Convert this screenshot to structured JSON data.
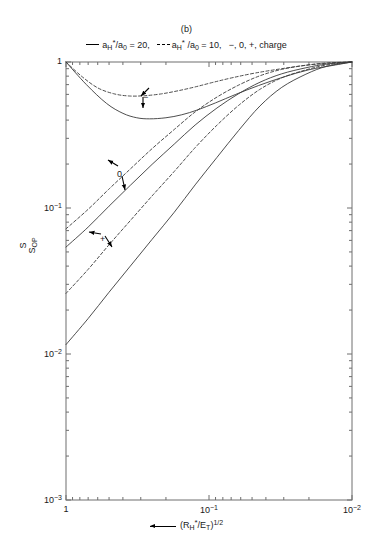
{
  "figure": {
    "panel_label": "(b)",
    "legend": {
      "entry1": {
        "style": "solid",
        "text_pre": "a",
        "sub1": "H",
        "ast": "*",
        "mid": "/a",
        "sub2": "0",
        "value": " = 20,"
      },
      "entry2": {
        "style": "dashed",
        "text_pre": "a",
        "sub1": "H",
        "ast": "*",
        "mid": " /a",
        "sub2": "0",
        "value": " = 10,"
      },
      "entry3": "−, 0, +, charge"
    }
  },
  "axes": {
    "ylabel_num": "S",
    "ylabel_den": "S",
    "ylabel_den_sub": "OP",
    "xlabel_prefix": "(R",
    "xlabel_sub1": "H",
    "xlabel_ast": "*",
    "xlabel_mid": "/E",
    "xlabel_sub2": "T",
    "xlabel_suffix": ")",
    "xlabel_sup": "1/2",
    "yticks": [
      {
        "value": 1,
        "label_mantissa": "1",
        "label_exp": ""
      },
      {
        "value": 0.1,
        "label_mantissa": "10",
        "label_exp": "−1"
      },
      {
        "value": 0.01,
        "label_mantissa": "10",
        "label_exp": "−2"
      },
      {
        "value": 0.001,
        "label_mantissa": "10",
        "label_exp": "−3"
      }
    ],
    "xticks": [
      {
        "value": 1,
        "label_mantissa": "1",
        "label_exp": ""
      },
      {
        "value": 0.1,
        "label_mantissa": "10",
        "label_exp": "−1"
      },
      {
        "value": 0.01,
        "label_mantissa": "10",
        "label_exp": "−2"
      }
    ],
    "xlim": [
      1,
      0.01
    ],
    "ylim": [
      0.001,
      1
    ],
    "xscale": "log",
    "yscale": "log",
    "x_reversed": true
  },
  "annotations": [
    {
      "name": "minus-annotation",
      "text": "−",
      "x_px": 143,
      "y_px": 93
    },
    {
      "name": "zero-annotation",
      "text": "0",
      "x_px": 117,
      "y_px": 170
    },
    {
      "name": "plus-annotation",
      "text": "+",
      "x_px": 100,
      "y_px": 235
    }
  ],
  "chart_data": {
    "type": "line",
    "title": "(b)",
    "xlabel": "← (R*_H/E_T)^(1/2)",
    "ylabel": "S/S_OP",
    "xscale": "log",
    "yscale": "log",
    "xlim": [
      1,
      0.01
    ],
    "ylim": [
      0.001,
      1
    ],
    "x_axis_reversed": true,
    "grid": false,
    "legend_position": "above-axes",
    "legend_entries": [
      "a*_H/a_0 = 20 (solid)",
      "a*_H/a_0 = 10 (dashed)",
      "−, 0, +, charge"
    ],
    "series": [
      {
        "name": "minus-solid",
        "charge": "−",
        "ratio": "a*_H/a_0 = 20",
        "style": "solid",
        "x": [
          1.0,
          0.72,
          0.52,
          0.4,
          0.32,
          0.26,
          0.2,
          0.155,
          0.12,
          0.09,
          0.065,
          0.045,
          0.03,
          0.02,
          0.013,
          0.01
        ],
        "y": [
          1.0,
          0.7,
          0.52,
          0.445,
          0.415,
          0.408,
          0.415,
          0.435,
          0.47,
          0.525,
          0.6,
          0.69,
          0.79,
          0.885,
          0.955,
          1.0
        ]
      },
      {
        "name": "minus-dashed",
        "charge": "−",
        "ratio": "a*_H/a_0 = 10",
        "style": "dashed",
        "x": [
          1.0,
          0.78,
          0.6,
          0.46,
          0.36,
          0.28,
          0.215,
          0.165,
          0.125,
          0.094,
          0.068,
          0.047,
          0.031,
          0.021,
          0.014,
          0.01
        ],
        "y": [
          1.0,
          0.8,
          0.665,
          0.605,
          0.585,
          0.588,
          0.605,
          0.635,
          0.675,
          0.725,
          0.782,
          0.842,
          0.9,
          0.95,
          0.985,
          1.0
        ]
      },
      {
        "name": "zero-dashed",
        "charge": "0",
        "ratio": "a*_H/a_0 = 10",
        "style": "dashed",
        "x": [
          1.0,
          0.7,
          0.5,
          0.355,
          0.25,
          0.175,
          0.125,
          0.088,
          0.062,
          0.044,
          0.031,
          0.021,
          0.015,
          0.01
        ],
        "y": [
          0.072,
          0.098,
          0.135,
          0.185,
          0.255,
          0.345,
          0.455,
          0.575,
          0.695,
          0.805,
          0.89,
          0.95,
          0.985,
          1.0
        ]
      },
      {
        "name": "zero-solid",
        "charge": "0",
        "ratio": "a*_H/a_0 = 20",
        "style": "solid",
        "x": [
          1.0,
          0.7,
          0.5,
          0.355,
          0.25,
          0.175,
          0.125,
          0.088,
          0.062,
          0.044,
          0.031,
          0.021,
          0.015,
          0.01
        ],
        "y": [
          0.054,
          0.074,
          0.103,
          0.143,
          0.199,
          0.274,
          0.37,
          0.484,
          0.607,
          0.727,
          0.83,
          0.913,
          0.968,
          1.0
        ]
      },
      {
        "name": "plus-dashed",
        "charge": "+",
        "ratio": "a*_H/a_0 = 10",
        "style": "dashed",
        "x": [
          1.0,
          0.7,
          0.5,
          0.355,
          0.25,
          0.175,
          0.125,
          0.088,
          0.062,
          0.044,
          0.031,
          0.021,
          0.015,
          0.01
        ],
        "y": [
          0.026,
          0.038,
          0.056,
          0.082,
          0.121,
          0.178,
          0.259,
          0.369,
          0.505,
          0.65,
          0.779,
          0.883,
          0.955,
          1.0
        ]
      },
      {
        "name": "plus-solid",
        "charge": "+",
        "ratio": "a*_H/a_0 = 20",
        "style": "solid",
        "x": [
          1.0,
          0.7,
          0.5,
          0.355,
          0.25,
          0.175,
          0.125,
          0.088,
          0.062,
          0.044,
          0.031,
          0.021,
          0.015,
          0.01
        ],
        "y": [
          0.0116,
          0.0175,
          0.0265,
          0.04,
          0.061,
          0.0935,
          0.144,
          0.222,
          0.34,
          0.5,
          0.67,
          0.825,
          0.935,
          1.0
        ]
      }
    ]
  }
}
